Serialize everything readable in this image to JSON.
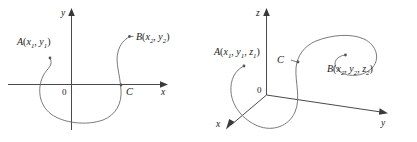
{
  "figure": {
    "background_color": "#ffffff",
    "curve_color": "#6b6b6b",
    "axis_color": "#4a4a4a",
    "text_color": "#1a1a1a",
    "panels": [
      {
        "id": "plane-curve",
        "dimension": "2d",
        "axes": [
          {
            "name": "x-axis",
            "label": "x"
          },
          {
            "name": "y-axis",
            "label": "y"
          }
        ],
        "origin_label": "0",
        "curve_label": "C",
        "points": [
          {
            "name": "A",
            "label_base": "A",
            "open_paren": "(",
            "close_paren": ")",
            "coords": [
              {
                "var": "x",
                "sub": "1"
              },
              {
                "var": "y",
                "sub": "1"
              }
            ],
            "separator": ", "
          },
          {
            "name": "B",
            "label_base": "B",
            "open_paren": "(",
            "close_paren": ")",
            "coords": [
              {
                "var": "x",
                "sub": "2"
              },
              {
                "var": "y",
                "sub": "2"
              }
            ],
            "separator": ", "
          }
        ]
      },
      {
        "id": "space-curve",
        "dimension": "3d",
        "axes": [
          {
            "name": "x-axis",
            "label": "x"
          },
          {
            "name": "y-axis",
            "label": "y"
          },
          {
            "name": "z-axis",
            "label": "z"
          }
        ],
        "origin_label": "0",
        "curve_label": "C",
        "points": [
          {
            "name": "A",
            "label_base": "A",
            "open_paren": "(",
            "close_paren": ")",
            "coords": [
              {
                "var": "x",
                "sub": "1"
              },
              {
                "var": "y",
                "sub": "1"
              },
              {
                "var": "z",
                "sub": "1"
              }
            ],
            "separator": ", "
          },
          {
            "name": "B",
            "label_base": "B",
            "open_paren": "(",
            "close_paren": ")",
            "coords": [
              {
                "var": "x",
                "sub": "2"
              },
              {
                "var": "y",
                "sub": "2"
              },
              {
                "var": "z",
                "sub": "2"
              }
            ],
            "separator": ", "
          }
        ]
      }
    ]
  }
}
